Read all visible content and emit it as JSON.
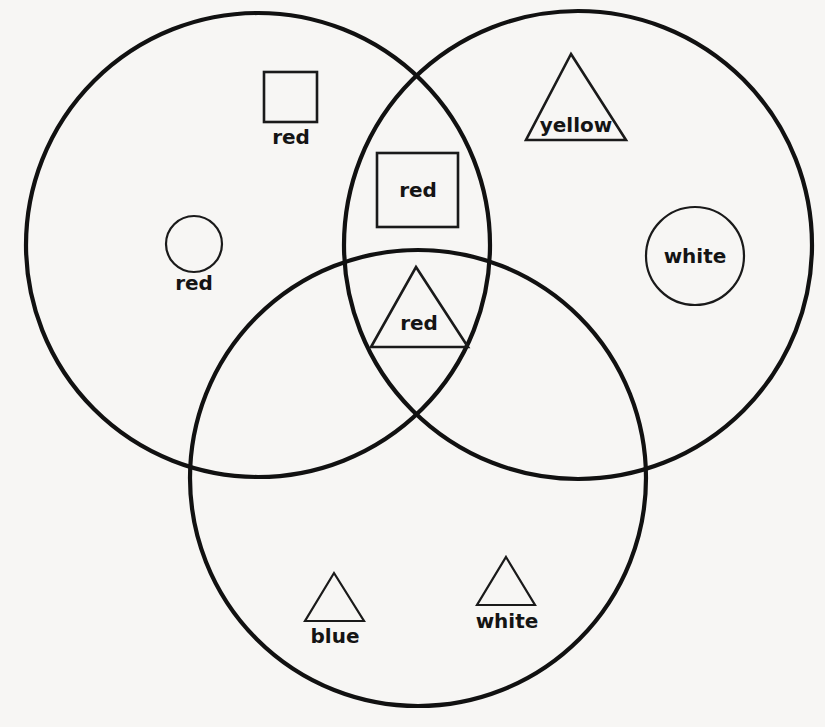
{
  "diagram": {
    "background_color": "#f7f6f4",
    "stroke_color": "#111111",
    "sets": [
      {
        "id": "left-set",
        "name": "left-circle",
        "cx": 258,
        "cy": 245,
        "r": 232
      },
      {
        "id": "right-set",
        "name": "right-circle",
        "cx": 578,
        "cy": 245,
        "r": 234
      },
      {
        "id": "bottom-set",
        "name": "bottom-circle",
        "cx": 418,
        "cy": 478,
        "r": 228
      }
    ],
    "shapes": [
      {
        "id": "square-red-left",
        "kind": "square",
        "label": "red",
        "label_position": "below",
        "region": "left-only",
        "x": 264,
        "y": 72,
        "w": 53,
        "h": 50,
        "label_x": 291,
        "label_y": 144
      },
      {
        "id": "square-red-center-top",
        "kind": "square",
        "label": "red",
        "label_position": "inside",
        "region": "left-right-overlap",
        "x": 377,
        "y": 153,
        "w": 81,
        "h": 74,
        "label_x": 418,
        "label_y": 197
      },
      {
        "id": "circle-red-left",
        "kind": "circle",
        "label": "red",
        "label_position": "below",
        "region": "left-only",
        "cx": 194,
        "cy": 244,
        "r": 28,
        "label_x": 194,
        "label_y": 290
      },
      {
        "id": "triangle-yellow",
        "kind": "triangle",
        "label": "yellow",
        "label_position": "inside",
        "region": "right-only",
        "apex_x": 571,
        "apex_y": 54,
        "base_left_x": 526,
        "base_right_x": 626,
        "base_y": 140,
        "label_x": 576,
        "label_y": 132
      },
      {
        "id": "circle-white-right",
        "kind": "circle",
        "label": "white",
        "label_position": "inside",
        "region": "right-only",
        "cx": 695,
        "cy": 256,
        "r": 49,
        "label_x": 695,
        "label_y": 263
      },
      {
        "id": "triangle-red-center",
        "kind": "triangle",
        "label": "red",
        "label_position": "inside",
        "region": "all-three-overlap",
        "apex_x": 416,
        "apex_y": 267,
        "base_left_x": 371,
        "base_right_x": 468,
        "base_y": 347,
        "label_x": 419,
        "label_y": 330
      },
      {
        "id": "triangle-blue-bottom",
        "kind": "triangle",
        "label": "blue",
        "label_position": "below",
        "region": "bottom-only",
        "apex_x": 334,
        "apex_y": 573,
        "base_left_x": 305,
        "base_right_x": 364,
        "base_y": 621,
        "label_x": 335,
        "label_y": 643
      },
      {
        "id": "triangle-white-bottom",
        "kind": "triangle",
        "label": "white",
        "label_position": "below",
        "region": "bottom-only",
        "apex_x": 506,
        "apex_y": 557,
        "base_left_x": 477,
        "base_right_x": 535,
        "base_y": 605,
        "label_x": 507,
        "label_y": 628
      }
    ]
  }
}
